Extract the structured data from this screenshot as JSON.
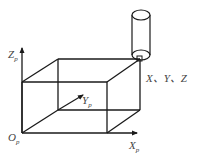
{
  "diagram": {
    "type": "coordinate-system-box",
    "axes": {
      "z": {
        "label": "Z",
        "subscript": "p"
      },
      "y": {
        "label": "Y",
        "subscript": "p"
      },
      "x": {
        "label": "X",
        "subscript": "p"
      },
      "origin": {
        "label": "O",
        "subscript": "p"
      }
    },
    "tool_label": "X、Y、Z",
    "colors": {
      "stroke": "#1a1a1a",
      "text": "#444444",
      "background": "#ffffff"
    }
  }
}
